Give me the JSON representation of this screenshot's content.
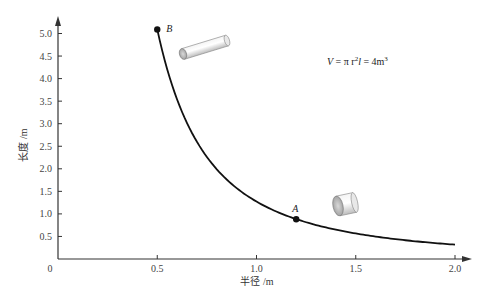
{
  "chart_data": {
    "type": "line",
    "title": "",
    "xlabel": "半径 /m",
    "ylabel": "长度 /m",
    "xlim": [
      0,
      2.0
    ],
    "ylim": [
      0,
      5.0
    ],
    "origin_label": "0",
    "x_ticks": [
      0.5,
      1.0,
      1.5,
      2.0
    ],
    "x_tick_labels": [
      "0.5",
      "1.0",
      "1.5",
      "2.0"
    ],
    "y_ticks": [
      0.5,
      1.0,
      1.5,
      2.0,
      2.5,
      3.0,
      3.5,
      4.0,
      4.5,
      5.0
    ],
    "y_tick_labels": [
      "0.5",
      "1.0",
      "1.5",
      "2.0",
      "2.5",
      "3.0",
      "3.5",
      "4.0",
      "4.5",
      "5.0"
    ],
    "grid": false,
    "series": [
      {
        "name": "l = V/(π r²), V = 4 m³",
        "function": "4/(pi*r^2)",
        "x_range": [
          0.5,
          2.0
        ],
        "color": "#111111"
      }
    ],
    "points": [
      {
        "label": "B",
        "x": 0.5,
        "y": 5.09
      },
      {
        "label": "A",
        "x": 1.2,
        "y": 0.88
      }
    ],
    "annotation": "V = π r²l = 4m³",
    "annotation_parts": {
      "lhs": "V",
      "eq": " = π r",
      "sup1": "2",
      "l": "l",
      "rhs": " = 4m",
      "sup2": "3"
    }
  }
}
